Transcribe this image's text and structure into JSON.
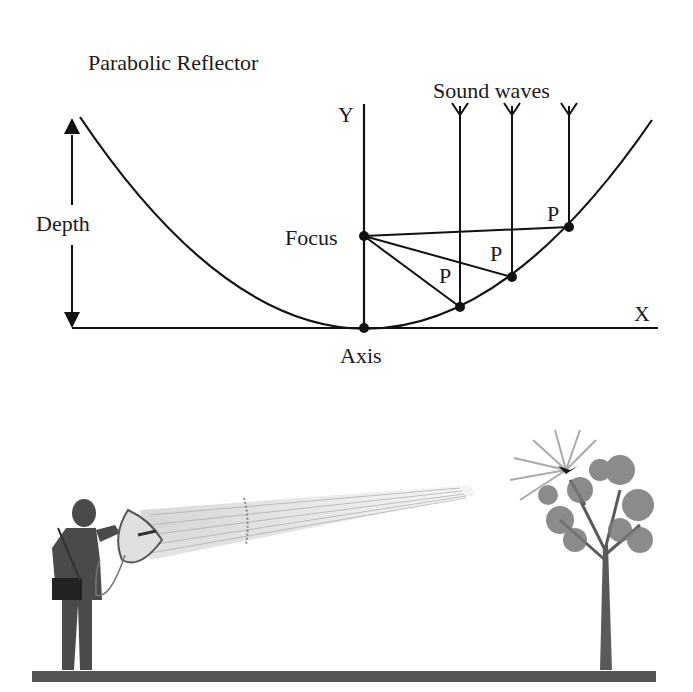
{
  "diagram": {
    "title": "Parabolic Reflector",
    "labels": {
      "y_axis": "Y",
      "x_axis": "X",
      "depth": "Depth",
      "focus": "Focus",
      "axis": "Axis",
      "sound_waves": "Sound waves",
      "point": "P"
    },
    "points": [
      {
        "label": "P",
        "x": 460,
        "y": 307
      },
      {
        "label": "P",
        "x": 512,
        "y": 277
      },
      {
        "label": "P",
        "x": 569,
        "y": 227
      }
    ],
    "focus_point": {
      "x": 364,
      "y": 236
    },
    "vertex": {
      "x": 364,
      "y": 328
    }
  },
  "illustration": {
    "description": "Person holding a parabolic microphone aimed at a bird singing in a tree",
    "colors": {
      "ground": "#555555",
      "figure": "#4a4a4a",
      "beam": "#c8c8c8",
      "tree": "#666666",
      "bird": "#1a1a1a"
    }
  }
}
